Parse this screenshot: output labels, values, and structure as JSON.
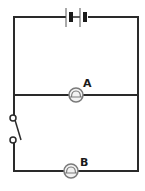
{
  "diagram": {
    "type": "circuit",
    "colors": {
      "wire": "#2a2a2a",
      "bulb_stroke": "#7a7a7a",
      "bulb_fill": "#f2f2f2",
      "label": "#1a1a1a"
    },
    "components": {
      "battery": {
        "cells": 2,
        "position": "top-wire"
      },
      "bulb_a": {
        "label": "A",
        "position": "middle-wire"
      },
      "bulb_b": {
        "label": "B",
        "position": "bottom-wire"
      },
      "switch": {
        "state": "open",
        "position": "left-wire-lower"
      }
    }
  }
}
